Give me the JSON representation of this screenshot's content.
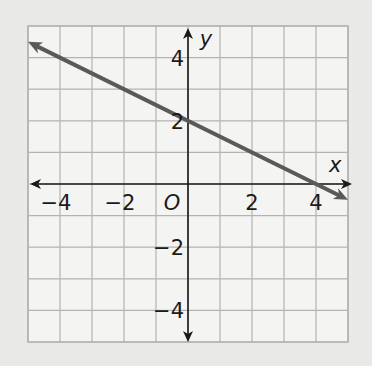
{
  "chart_data": {
    "type": "line",
    "title": "",
    "xlabel": "x",
    "ylabel": "y",
    "origin_label": "O",
    "xlim": [
      -5,
      5
    ],
    "ylim": [
      -5,
      5
    ],
    "grid": true,
    "grid_step": 1,
    "x_ticks": [
      -4,
      -2,
      2,
      4
    ],
    "y_ticks": [
      4,
      2,
      -2,
      -4
    ],
    "x_tick_labels": [
      "−4",
      "−2",
      "2",
      "4"
    ],
    "y_tick_labels": [
      "4",
      "2",
      "−2",
      "−4"
    ],
    "series": [
      {
        "name": "line",
        "equation": "y = -0.5x + 2",
        "slope": -0.5,
        "intercept": 2,
        "x": [
          -5,
          0,
          4,
          5
        ],
        "y": [
          4.5,
          2,
          0,
          -0.5
        ],
        "arrows": "both",
        "color": "#5a5a5a"
      }
    ]
  },
  "colors": {
    "background": "#e9e9e7",
    "grid_fill": "#f4f4f2",
    "grid_line": "#b3b3b3",
    "axis": "#1a1a1a",
    "line": "#5a5a5a"
  }
}
